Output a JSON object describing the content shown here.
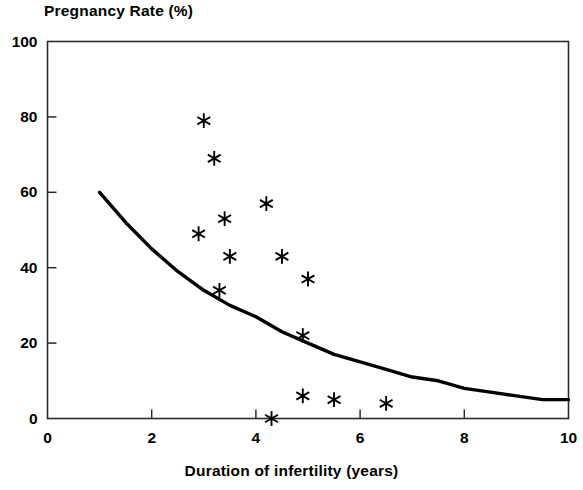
{
  "chart_data": {
    "type": "scatter",
    "title": "Pregnancy Rate (%)",
    "xlabel": "Duration of infertility (years)",
    "ylabel": "Pregnancy Rate (%)",
    "xlim": [
      0,
      10
    ],
    "ylim": [
      0,
      100
    ],
    "xticks": [
      0,
      2,
      4,
      6,
      8,
      10
    ],
    "yticks": [
      0,
      20,
      40,
      60,
      80,
      100
    ],
    "xtick_labels": [
      "0",
      "2",
      "4",
      "6",
      "8",
      "10"
    ],
    "ytick_labels": [
      "0",
      "20",
      "40",
      "60",
      "80",
      "100"
    ],
    "grid": false,
    "legend": "none",
    "marker": "asterisk",
    "marker_color": "#000000",
    "line_color": "#000000",
    "background": "#ffffff",
    "series": [
      {
        "name": "Observed pregnancy rate",
        "type": "scatter",
        "marker": "asterisk",
        "points": [
          {
            "x": 3.0,
            "y": 79
          },
          {
            "x": 3.2,
            "y": 69
          },
          {
            "x": 2.9,
            "y": 49
          },
          {
            "x": 3.4,
            "y": 53
          },
          {
            "x": 4.2,
            "y": 57
          },
          {
            "x": 3.5,
            "y": 43
          },
          {
            "x": 4.5,
            "y": 43
          },
          {
            "x": 3.3,
            "y": 34
          },
          {
            "x": 5.0,
            "y": 37
          },
          {
            "x": 4.9,
            "y": 22
          },
          {
            "x": 4.3,
            "y": 0
          },
          {
            "x": 4.9,
            "y": 6
          },
          {
            "x": 5.5,
            "y": 5
          },
          {
            "x": 6.5,
            "y": 4
          }
        ]
      },
      {
        "name": "Fitted decline curve",
        "type": "line",
        "points": [
          {
            "x": 1.0,
            "y": 60
          },
          {
            "x": 1.5,
            "y": 52
          },
          {
            "x": 2.0,
            "y": 45
          },
          {
            "x": 2.5,
            "y": 39
          },
          {
            "x": 3.0,
            "y": 34
          },
          {
            "x": 3.5,
            "y": 30
          },
          {
            "x": 4.0,
            "y": 27
          },
          {
            "x": 4.5,
            "y": 23
          },
          {
            "x": 5.0,
            "y": 20
          },
          {
            "x": 5.5,
            "y": 17
          },
          {
            "x": 6.0,
            "y": 15
          },
          {
            "x": 6.5,
            "y": 13
          },
          {
            "x": 7.0,
            "y": 11
          },
          {
            "x": 7.5,
            "y": 10
          },
          {
            "x": 8.0,
            "y": 8
          },
          {
            "x": 8.5,
            "y": 7
          },
          {
            "x": 9.0,
            "y": 6
          },
          {
            "x": 9.5,
            "y": 5
          },
          {
            "x": 10.0,
            "y": 5
          }
        ]
      }
    ]
  }
}
